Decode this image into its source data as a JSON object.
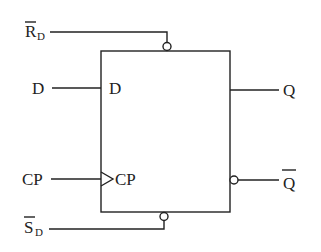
{
  "diagram": {
    "type": "D flip-flop logic symbol",
    "colors": {
      "stroke": "#222222",
      "background": "#ffffff"
    },
    "inputs": [
      {
        "id": "rd",
        "label": "R",
        "subscript": "D",
        "overbar": true,
        "active_low": true,
        "position": "top"
      },
      {
        "id": "d",
        "label": "D",
        "inner_label": "D",
        "position": "left"
      },
      {
        "id": "cp",
        "label": "CP",
        "inner_label": "CP",
        "clock_triangle": true,
        "position": "left"
      },
      {
        "id": "sd",
        "label": "S",
        "subscript": "D",
        "overbar": true,
        "active_low": true,
        "position": "bottom"
      }
    ],
    "outputs": [
      {
        "id": "q",
        "label": "Q",
        "overbar": false,
        "position": "right"
      },
      {
        "id": "qbar",
        "label": "Q",
        "overbar": true,
        "inverted_bubble": true,
        "position": "right"
      }
    ]
  }
}
